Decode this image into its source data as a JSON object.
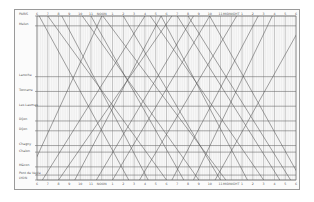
{
  "diagram": {
    "time_axis": {
      "top_labels": [
        "6",
        "7",
        "8",
        "9",
        "10",
        "11",
        "NOON",
        "1",
        "2",
        "3",
        "4",
        "5",
        "6",
        "7",
        "8",
        "9",
        "10",
        "11",
        "MIDNIGHT",
        "1",
        "2",
        "3",
        "4",
        "5",
        "6"
      ],
      "bottom_labels": [
        "6",
        "7",
        "8",
        "9",
        "10",
        "11",
        "NOON",
        "1",
        "2",
        "3",
        "4",
        "5",
        "6",
        "7",
        "8",
        "9",
        "10",
        "11",
        "MIDNIGHT",
        "1",
        "2",
        "3",
        "4",
        "5",
        "6"
      ],
      "start_hour": 6,
      "end_hour": 30
    },
    "stations": [
      {
        "name": "PARIS",
        "pos": 0.0
      },
      {
        "name": "Melun",
        "pos": 0.06
      },
      {
        "name": "Laroche",
        "pos": 0.37
      },
      {
        "name": "Tonnerre",
        "pos": 0.46
      },
      {
        "name": "Les Laumes",
        "pos": 0.55
      },
      {
        "name": "Dijon",
        "pos": 0.64
      },
      {
        "name": "Dijon",
        "pos": 0.7
      },
      {
        "name": "Chagny",
        "pos": 0.79
      },
      {
        "name": "Chalon",
        "pos": 0.83
      },
      {
        "name": "Mâcon",
        "pos": 0.92
      },
      {
        "name": "Pont de Veyle",
        "pos": 0.97
      },
      {
        "name": "LYON",
        "pos": 1.0
      }
    ],
    "trains": [
      {
        "dir": "down",
        "dep": 6.2,
        "arr": 14.5
      },
      {
        "dir": "down",
        "dep": 7.0,
        "arr": 18.0
      },
      {
        "dir": "down",
        "dep": 8.3,
        "arr": 16.3
      },
      {
        "dir": "down",
        "dep": 10.2,
        "arr": 21.0
      },
      {
        "dir": "down",
        "dep": 11.0,
        "arr": 19.6
      },
      {
        "dir": "down",
        "dep": 12.1,
        "arr": 23.5
      },
      {
        "dir": "down",
        "dep": 14.0,
        "arr": 23.0
      },
      {
        "dir": "down",
        "dep": 16.5,
        "arr": 27.0
      },
      {
        "dir": "down",
        "dep": 17.5,
        "arr": 25.5
      },
      {
        "dir": "down",
        "dep": 19.0,
        "arr": 28.5
      },
      {
        "dir": "down",
        "dep": 20.0,
        "arr": 29.5
      },
      {
        "dir": "down",
        "dep": 22.0,
        "arr": 30.5
      },
      {
        "dir": "up",
        "dep": 5.0,
        "arr": 12.0
      },
      {
        "dir": "up",
        "dep": 6.5,
        "arr": 16.0
      },
      {
        "dir": "up",
        "dep": 8.0,
        "arr": 18.5
      },
      {
        "dir": "up",
        "dep": 9.5,
        "arr": 17.5
      },
      {
        "dir": "up",
        "dep": 11.5,
        "arr": 20.5
      },
      {
        "dir": "up",
        "dep": 13.0,
        "arr": 22.0
      },
      {
        "dir": "up",
        "dep": 15.5,
        "arr": 24.5
      },
      {
        "dir": "up",
        "dep": 18.5,
        "arr": 26.5
      },
      {
        "dir": "up",
        "dep": 20.5,
        "arr": 27.8
      },
      {
        "dir": "up",
        "dep": 22.5,
        "arr": 31.0
      }
    ]
  }
}
